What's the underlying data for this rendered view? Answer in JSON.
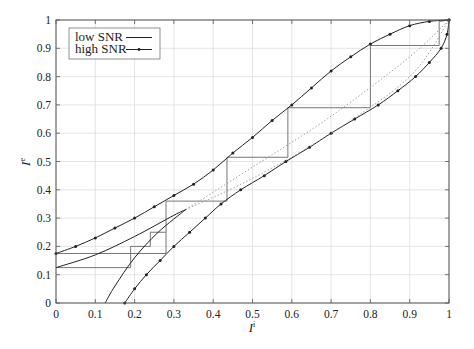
{
  "chart_data": {
    "type": "line",
    "title": "",
    "xlabel": "I^i",
    "ylabel": "I^e",
    "xlim": [
      0,
      1
    ],
    "ylim": [
      0,
      1
    ],
    "grid": true,
    "legend_position": "upper left",
    "x_ticks": [
      "0",
      "0.1",
      "0.2",
      "0.3",
      "0.4",
      "0.5",
      "0.6",
      "0.7",
      "0.8",
      "0.9",
      "1"
    ],
    "y_ticks": [
      "0",
      "0.1",
      "0.2",
      "0.3",
      "0.4",
      "0.5",
      "0.6",
      "0.7",
      "0.8",
      "0.9",
      "1"
    ],
    "legend": [
      {
        "name": "low SNR",
        "style": "solid"
      },
      {
        "name": "high SNR",
        "style": "solid-marker"
      }
    ],
    "series": [
      {
        "name": "high SNR (VND curve)",
        "marker": true,
        "x": [
          0,
          0.05,
          0.1,
          0.15,
          0.2,
          0.25,
          0.3,
          0.35,
          0.4,
          0.45,
          0.5,
          0.55,
          0.6,
          0.65,
          0.7,
          0.75,
          0.8,
          0.85,
          0.9,
          0.95,
          1
        ],
        "y": [
          0.175,
          0.2,
          0.23,
          0.265,
          0.3,
          0.34,
          0.38,
          0.42,
          0.47,
          0.53,
          0.585,
          0.645,
          0.7,
          0.76,
          0.82,
          0.87,
          0.915,
          0.95,
          0.98,
          0.995,
          1
        ]
      },
      {
        "name": "high SNR (CND curve, inverted)",
        "marker": true,
        "x": [
          0.175,
          0.2,
          0.23,
          0.265,
          0.3,
          0.34,
          0.38,
          0.42,
          0.47,
          0.53,
          0.585,
          0.645,
          0.7,
          0.76,
          0.82,
          0.87,
          0.915,
          0.95,
          0.98,
          0.995,
          1
        ],
        "y": [
          0,
          0.05,
          0.1,
          0.15,
          0.2,
          0.25,
          0.3,
          0.35,
          0.4,
          0.45,
          0.5,
          0.55,
          0.6,
          0.65,
          0.7,
          0.75,
          0.8,
          0.85,
          0.9,
          0.95,
          1
        ]
      },
      {
        "name": "low SNR (VND curve)",
        "marker": false,
        "x": [
          0,
          0.1,
          0.2,
          0.3,
          0.33
        ],
        "y": [
          0.125,
          0.17,
          0.235,
          0.31,
          0.33
        ],
        "dotted_continuation": {
          "x": [
            0.33,
            0.5,
            0.7,
            0.9,
            1
          ],
          "y": [
            0.33,
            0.48,
            0.66,
            0.87,
            1
          ]
        }
      },
      {
        "name": "low SNR (CND curve, inverted)",
        "marker": false,
        "x": [
          0.125,
          0.15,
          0.2,
          0.26,
          0.33
        ],
        "y": [
          0,
          0.06,
          0.16,
          0.25,
          0.33
        ],
        "dotted_continuation": {
          "x": [
            0.33,
            0.5,
            0.7,
            0.9,
            1
          ],
          "y": [
            0.33,
            0.44,
            0.6,
            0.8,
            1
          ]
        }
      },
      {
        "name": "decoding trajectory (high SNR)",
        "style": "staircase",
        "x": [
          0,
          0.28,
          0.28,
          0.435,
          0.435,
          0.59,
          0.59,
          0.8,
          0.8,
          0.975,
          0.975,
          1
        ],
        "y": [
          0.175,
          0.175,
          0.36,
          0.36,
          0.515,
          0.515,
          0.69,
          0.69,
          0.91,
          0.91,
          0.995,
          1
        ]
      },
      {
        "name": "decoding trajectory (low SNR)",
        "style": "staircase",
        "x": [
          0,
          0.19,
          0.19,
          0.24,
          0.24,
          0.28
        ],
        "y": [
          0.125,
          0.125,
          0.2,
          0.2,
          0.25,
          0.25
        ]
      }
    ]
  }
}
